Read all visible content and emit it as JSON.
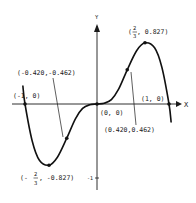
{
  "chart_data": {
    "type": "line",
    "title": "",
    "xlabel": "X",
    "ylabel": "Y",
    "xlim": [
      -1.05,
      1.05
    ],
    "ylim": [
      -1.05,
      1.05
    ],
    "grid": false,
    "y_tick_labels": [
      {
        "value": -1,
        "label": "-1"
      }
    ],
    "curve_points": [
      {
        "x": -1.03,
        "y": 0.25
      },
      {
        "x": -1.0,
        "y": 0.0
      },
      {
        "x": -0.9,
        "y": -0.5
      },
      {
        "x": -0.8,
        "y": -0.76
      },
      {
        "x": -0.6667,
        "y": -0.827
      },
      {
        "x": -0.55,
        "y": -0.72
      },
      {
        "x": -0.42,
        "y": -0.462
      },
      {
        "x": -0.3,
        "y": -0.2
      },
      {
        "x": -0.2,
        "y": -0.06
      },
      {
        "x": -0.1,
        "y": -0.01
      },
      {
        "x": 0.0,
        "y": 0.0
      },
      {
        "x": 0.1,
        "y": 0.01
      },
      {
        "x": 0.2,
        "y": 0.06
      },
      {
        "x": 0.3,
        "y": 0.2
      },
      {
        "x": 0.42,
        "y": 0.462
      },
      {
        "x": 0.55,
        "y": 0.72
      },
      {
        "x": 0.6667,
        "y": 0.827
      },
      {
        "x": 0.8,
        "y": 0.76
      },
      {
        "x": 0.9,
        "y": 0.5
      },
      {
        "x": 1.0,
        "y": 0.0
      },
      {
        "x": 1.03,
        "y": -0.25
      }
    ],
    "labeled_points": [
      {
        "x": -1.0,
        "y": 0.0,
        "label": "(-1, 0)"
      },
      {
        "x": -0.6667,
        "y": -0.827,
        "label_prefix": "(-",
        "label_num": "2",
        "label_den": "3",
        "label_suffix": ", -0.827)"
      },
      {
        "x": -0.42,
        "y": -0.462,
        "label": "(-0.420,-0.462)"
      },
      {
        "x": 0.0,
        "y": 0.0,
        "label": "(0, 0)"
      },
      {
        "x": 0.42,
        "y": 0.462,
        "label": "(0.420,0.462)"
      },
      {
        "x": 0.6667,
        "y": 0.827,
        "label_prefix": "(",
        "label_num": "2",
        "label_den": "3",
        "label_suffix": ", 0.827)"
      },
      {
        "x": 1.0,
        "y": 0.0,
        "label": "(1, 0)"
      }
    ]
  }
}
